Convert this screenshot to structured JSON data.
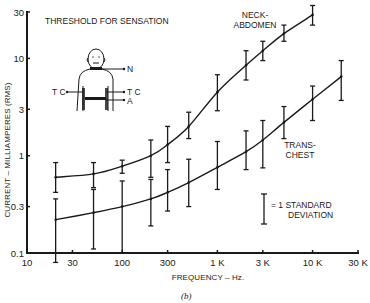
{
  "chart_data": {
    "type": "line",
    "title": "THRESHOLD FOR SENSATION",
    "caption": "(b)",
    "xlabel": "FREQUENCY – Hz.",
    "ylabel": "CURRENT – MILLIAMPERES (RMS)",
    "xscale": "log",
    "yscale": "log",
    "xlim": [
      10,
      30000
    ],
    "ylim": [
      0.1,
      30
    ],
    "grid": false,
    "x_ticks": [
      {
        "value": 10,
        "label": "10"
      },
      {
        "value": 30,
        "label": "30"
      },
      {
        "value": 100,
        "label": "100"
      },
      {
        "value": 300,
        "label": "300"
      },
      {
        "value": 1000,
        "label": "1 K"
      },
      {
        "value": 3000,
        "label": "3 K"
      },
      {
        "value": 10000,
        "label": "10 K"
      },
      {
        "value": 30000,
        "label": "30 K"
      }
    ],
    "y_ticks": [
      {
        "value": 0.1,
        "label": "0.1"
      },
      {
        "value": 0.3,
        "label": "0.3"
      },
      {
        "value": 1,
        "label": "1"
      },
      {
        "value": 3,
        "label": "3"
      },
      {
        "value": 10,
        "label": "10"
      },
      {
        "value": 30,
        "label": "30"
      }
    ],
    "series": [
      {
        "name": "NECK-ABDOMEN",
        "label_lines": [
          "NECK-",
          "ABDOMEN"
        ],
        "x": [
          20,
          50,
          100,
          200,
          300,
          500,
          1000,
          2000,
          3000,
          5000,
          10000
        ],
        "values": [
          0.6,
          0.65,
          0.78,
          1.0,
          1.3,
          2.0,
          4.5,
          8.5,
          12,
          18,
          28
        ],
        "err_low": [
          0.42,
          0.47,
          0.66,
          0.6,
          0.85,
          1.5,
          2.9,
          6.0,
          9.5,
          15,
          22
        ],
        "err_high": [
          0.85,
          0.85,
          0.9,
          1.45,
          2.0,
          2.8,
          6.8,
          12,
          15,
          22,
          35
        ]
      },
      {
        "name": "TRANS-CHEST",
        "label_lines": [
          "TRANS-",
          "CHEST"
        ],
        "x": [
          20,
          50,
          100,
          200,
          300,
          500,
          1000,
          2000,
          3000,
          5000,
          10000,
          20000
        ],
        "values": [
          0.22,
          0.26,
          0.3,
          0.36,
          0.42,
          0.53,
          0.76,
          1.1,
          1.45,
          2.2,
          3.8,
          6.5
        ],
        "err_low": [
          0.08,
          0.11,
          0.1,
          0.19,
          0.27,
          0.3,
          0.45,
          0.72,
          0.75,
          1.5,
          2.3,
          3.7
        ],
        "err_high": [
          0.36,
          0.45,
          0.55,
          0.57,
          0.72,
          0.92,
          1.4,
          1.8,
          2.3,
          3.2,
          5.2,
          9.5
        ]
      }
    ],
    "legend": {
      "symbol": "error-bar",
      "label_lines": [
        "= 1 STANDARD",
        "DEVIATION"
      ]
    },
    "inset": {
      "description": "human torso figure with electrode positions",
      "labels": {
        "neck": "N",
        "trans_chest_left": "T C",
        "trans_chest_right": "T C",
        "abdomen": "A"
      }
    }
  }
}
